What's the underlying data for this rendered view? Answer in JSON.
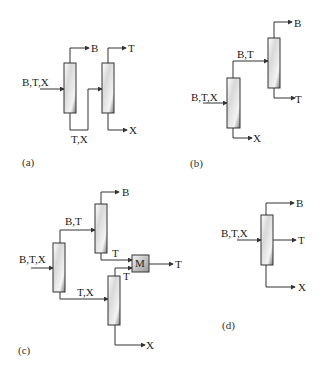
{
  "diagram": {
    "type": "distillation column sequences",
    "panels": [
      {
        "id": "a",
        "label": "(a)",
        "feed": "B,T,X",
        "streams": {
          "top1": "B",
          "middle": "T,X",
          "top2": "T",
          "bottom2": "X"
        }
      },
      {
        "id": "b",
        "label": "(b)",
        "feed": "B,T,X",
        "streams": {
          "top1": "B,T",
          "bottom1": "X",
          "top2": "B",
          "bottom2": "T"
        }
      },
      {
        "id": "c",
        "label": "(c)",
        "feed": "B,T,X",
        "streams": {
          "top1": "B,T",
          "bottom1": "T,X",
          "top2": "B",
          "bottom2": "T",
          "top3": "T",
          "bottom3": "X",
          "mixer": "M",
          "mixer_out": "T"
        }
      },
      {
        "id": "d",
        "label": "(d)",
        "feed": "B,T,X",
        "streams": {
          "top": "B",
          "side": "T",
          "bottom": "X"
        }
      }
    ]
  }
}
